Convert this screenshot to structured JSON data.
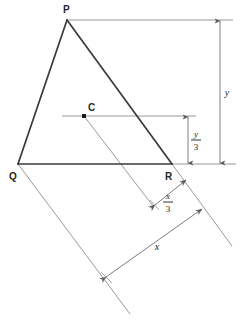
{
  "figure": {
    "type": "geometry-diagram",
    "background_color": "#ffffff",
    "triangle_stroke": "#3a3a3a",
    "construction_stroke": "#8c8c8c",
    "dimension_stroke": "#7d7d7d",
    "vertices": [
      {
        "name": "P",
        "label": "P",
        "x": 67,
        "y": 20,
        "label_x": 63,
        "label_y": 12
      },
      {
        "name": "Q",
        "label": "Q",
        "x": 18,
        "y": 164,
        "label_x": 9,
        "label_y": 179
      },
      {
        "name": "R",
        "label": "R",
        "x": 172,
        "y": 164,
        "label_x": 166,
        "label_y": 179
      }
    ],
    "centroid": {
      "name": "C",
      "label": "C",
      "x": 84,
      "y": 116,
      "label_x": 88,
      "label_y": 110
    },
    "dimensions": [
      {
        "name": "y",
        "label": "y",
        "label_x": 227,
        "label_y": 96,
        "from_y": 20,
        "to_y": 164,
        "axis_x": 220,
        "orientation": "vertical"
      },
      {
        "name": "y-over-3",
        "numerator": "y",
        "denominator": "3",
        "label_x": 193,
        "label_y": 134,
        "from_y": 116,
        "to_y": 164,
        "axis_x": 188,
        "orientation": "vertical"
      },
      {
        "name": "x",
        "label": "x",
        "label_x": 155,
        "label_y": 249,
        "orientation": "oblique"
      },
      {
        "name": "x-over-3",
        "numerator": "x",
        "denominator": "3",
        "label_x": 168,
        "label_y": 198,
        "orientation": "oblique"
      }
    ]
  }
}
